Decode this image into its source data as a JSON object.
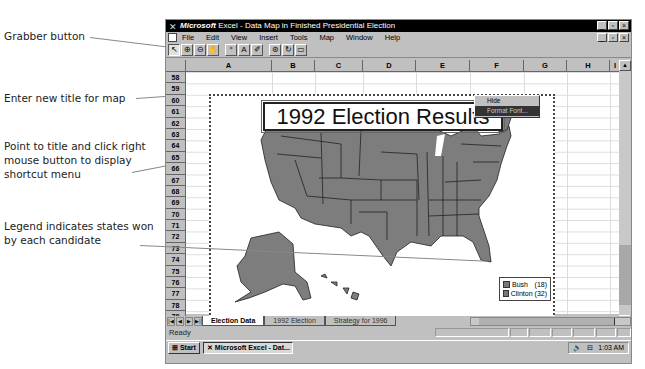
{
  "callouts": [
    {
      "text": "Grabber button"
    },
    {
      "text": "Enter new title for map"
    },
    {
      "text": "Point to title and click right mouse button to display shortcut menu"
    },
    {
      "text": "Legend indicates states won by each candidate"
    }
  ],
  "window": {
    "app_name": "Microsoft",
    "title": "Excel - Data Map in Finished Presidential Election",
    "controls": {
      "minimize": "_",
      "maximize": "▫",
      "close": "×"
    }
  },
  "menubar": {
    "items": [
      {
        "label": "File"
      },
      {
        "label": "Edit"
      },
      {
        "label": "View"
      },
      {
        "label": "Insert"
      },
      {
        "label": "Tools"
      },
      {
        "label": "Map"
      },
      {
        "label": "Window"
      },
      {
        "label": "Help"
      }
    ]
  },
  "toolbar": {
    "buttons": [
      {
        "icon": "select-pointer",
        "glyph": "↖"
      },
      {
        "icon": "zoom-in",
        "glyph": "⊕"
      },
      {
        "icon": "zoom-out",
        "glyph": "⊖"
      },
      {
        "icon": "grabber-hand",
        "glyph": "✋"
      },
      {
        "icon": "map-labels",
        "glyph": "⁺"
      },
      {
        "icon": "add-text",
        "glyph": "A"
      },
      {
        "icon": "custom-pin",
        "glyph": "✐"
      },
      {
        "icon": "display-entire",
        "glyph": "⊛"
      },
      {
        "icon": "redraw-map",
        "glyph": "↻"
      },
      {
        "icon": "show-control",
        "glyph": "▭"
      }
    ]
  },
  "sheet": {
    "columns": [
      "A",
      "B",
      "C",
      "D",
      "E",
      "F",
      "G",
      "H",
      "I"
    ],
    "rows": [
      "58",
      "59",
      "60",
      "61",
      "62",
      "63",
      "64",
      "65",
      "66",
      "67",
      "68",
      "69",
      "70",
      "71",
      "72",
      "73",
      "74",
      "75",
      "76",
      "77",
      "78",
      "79",
      "80"
    ]
  },
  "map": {
    "title": "1992 Election Results",
    "context_menu": [
      {
        "label": "Hide"
      },
      {
        "label": "Format Font..."
      }
    ],
    "legend": [
      {
        "label": "Bush",
        "count": "(18)",
        "color": "#8a8a8a"
      },
      {
        "label": "Clinton",
        "count": "(32)",
        "color": "#7a7a7a"
      }
    ]
  },
  "tabs": [
    {
      "label": "Election Data",
      "active": true
    },
    {
      "label": "1992 Election",
      "active": false
    },
    {
      "label": "Strategy for 1996",
      "active": false
    }
  ],
  "status": {
    "text": "Ready"
  },
  "taskbar": {
    "start_label": "Start",
    "task_label": "Microsoft Excel - Dat...",
    "clock": "1:03 AM"
  }
}
